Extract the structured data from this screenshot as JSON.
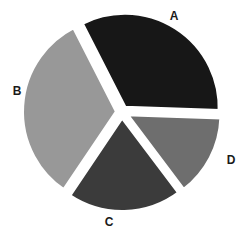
{
  "chart_data": {
    "type": "pie",
    "title": "",
    "subtitle": "",
    "xlabel": "",
    "ylabel": "",
    "grid": false,
    "legend_position": "none",
    "background_color": "#ffffff",
    "gap_color": "#ffffff",
    "labels": [
      "A",
      "B",
      "C",
      "D"
    ],
    "values": [
      33,
      33,
      20,
      14
    ],
    "percentages": [
      "33%",
      "33%",
      "20%",
      "14%"
    ],
    "colors": [
      "#171717",
      "#989898",
      "#3b3b3b",
      "#6e6e6e"
    ],
    "slices": [
      {
        "label": "A",
        "value": 33,
        "percent": "33%",
        "color": "#171717",
        "start_angle": 333,
        "end_angle": 452,
        "sweep_angle": 119,
        "exploded": true,
        "label_x": 174,
        "label_y": 16
      },
      {
        "label": "B",
        "value": 33,
        "percent": "33%",
        "color": "#989898",
        "start_angle": 214,
        "end_angle": 333,
        "sweep_angle": 119,
        "exploded": true,
        "label_x": 17,
        "label_y": 91
      },
      {
        "label": "C",
        "value": 20,
        "percent": "20%",
        "color": "#3b3b3b",
        "start_angle": 143,
        "end_angle": 214,
        "sweep_angle": 71,
        "exploded": true,
        "label_x": 109,
        "label_y": 222
      },
      {
        "label": "D",
        "value": 14,
        "percent": "14%",
        "color": "#6e6e6e",
        "start_angle": 92,
        "end_angle": 143,
        "sweep_angle": 51,
        "exploded": true,
        "label_x": 231,
        "label_y": 160
      }
    ],
    "geometry": {
      "center_x": 122,
      "center_y": 112,
      "radius": 95,
      "explode_distance": 5
    }
  }
}
